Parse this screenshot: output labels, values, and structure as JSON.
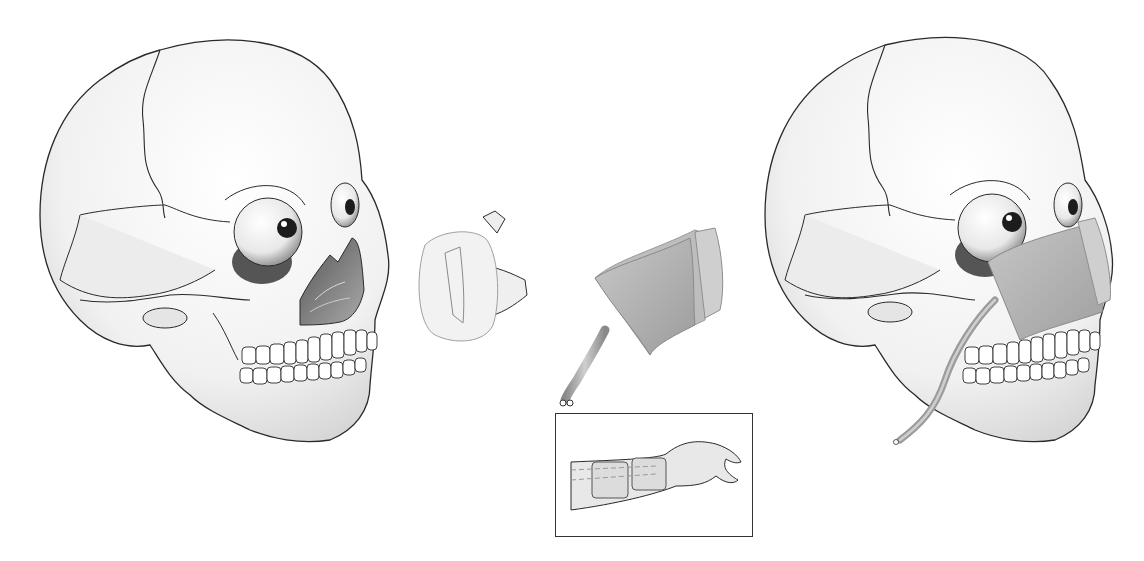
{
  "figure": {
    "panels": [
      {
        "id": "skull-left",
        "label": "Skull with maxillectomy defect"
      },
      {
        "id": "implant-a",
        "label": "Obturator / resected segment"
      },
      {
        "id": "flap",
        "label": "Free flap with vascular pedicle"
      },
      {
        "id": "inset",
        "label": "Forearm donor site"
      },
      {
        "id": "skull-right",
        "label": "Skull with flap inset"
      }
    ],
    "colors": {
      "background": "#ffffff",
      "outline": "#2a2a2a",
      "bone": "#f4f4f4",
      "shade": "#bdbdbd",
      "flap": "#a9a9a9",
      "flap_light": "#cfcfcf"
    }
  }
}
